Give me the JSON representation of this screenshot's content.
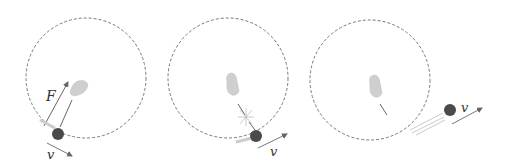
{
  "diagram": {
    "type": "circular-motion-sequence",
    "panels": [
      {
        "id": 1,
        "description": "Hand pulls ball on string with centripetal force F; ball moves with velocity v tangent to circle",
        "labels": {
          "force": "F",
          "velocity": "v"
        }
      },
      {
        "id": 2,
        "description": "String breaks (snap burst) near the ball",
        "labels": {
          "velocity": "v"
        }
      },
      {
        "id": 3,
        "description": "Ball flies off tangentially in a straight line",
        "labels": {
          "velocity": "v"
        }
      }
    ],
    "colors": {
      "circle": "#6a6a6a",
      "ball": "#4a4a4a",
      "hand": "#c8c8c8",
      "arrow": "#555555"
    }
  }
}
